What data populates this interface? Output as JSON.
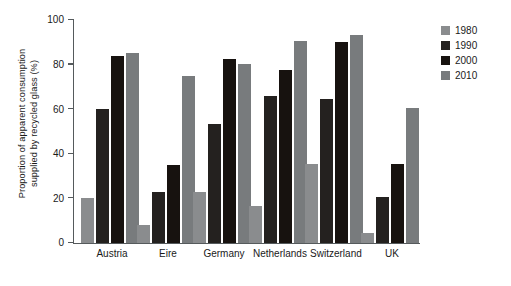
{
  "chart_data": {
    "type": "bar",
    "title": "",
    "xlabel": "",
    "ylabel": "Proportion of apparent consumption\nsupplied by recycled glass (%)",
    "ylim": [
      0,
      100
    ],
    "yticks": [
      0,
      20,
      40,
      60,
      80,
      100
    ],
    "ytick_labels": [
      "0",
      "20",
      "40",
      "60",
      "80",
      "100"
    ],
    "grid": false,
    "legend_position": "top-right",
    "categories": [
      "Austria",
      "Eire",
      "Germany",
      "Netherlands",
      "Switzerland",
      "UK"
    ],
    "series": [
      {
        "name": "1980",
        "color": "#8a8c8e",
        "values": [
          20,
          8,
          23,
          16.5,
          35.5,
          4.5
        ]
      },
      {
        "name": "1990",
        "color": "#24211f",
        "values": [
          60,
          23,
          53.5,
          66,
          64.5,
          20.5
        ]
      },
      {
        "name": "2000",
        "color": "#17120f",
        "values": [
          84,
          35,
          82.5,
          77.5,
          90,
          35.5
        ]
      },
      {
        "name": "2010",
        "color": "#787b7d",
        "values": [
          85,
          75,
          80.5,
          90.5,
          93.5,
          60.5
        ]
      }
    ]
  },
  "axis": {
    "line_color": "#555a5c"
  }
}
